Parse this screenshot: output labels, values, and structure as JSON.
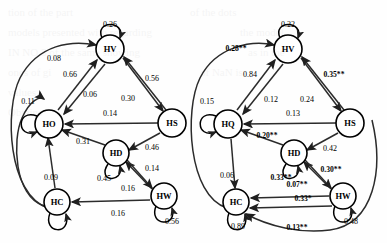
{
  "figure": {
    "type": "path-diagram-pair",
    "panels": [
      {
        "id": "left-panel",
        "name": "left-path-diagram",
        "nodes": [
          {
            "id": "HV",
            "label": "HV",
            "x": 110,
            "y": 49
          },
          {
            "id": "HO",
            "label": "HO",
            "x": 49,
            "y": 124
          },
          {
            "id": "HS",
            "label": "HS",
            "x": 172,
            "y": 123
          },
          {
            "id": "HD",
            "label": "HD",
            "x": 116,
            "y": 153
          },
          {
            "id": "HC",
            "label": "HC",
            "x": 57,
            "y": 202
          },
          {
            "id": "HW",
            "label": "HW",
            "x": 164,
            "y": 196
          }
        ],
        "self_loops": [
          {
            "node": "HV",
            "label": "0.26",
            "lx": 110,
            "ly": 24
          },
          {
            "node": "HO",
            "label": "0.11",
            "lx": 28,
            "ly": 101
          },
          {
            "node": "HD",
            "label": "0.45",
            "lx": 104,
            "ly": 178
          },
          {
            "node": "HW",
            "label": "0.56",
            "lx": 172,
            "ly": 221
          },
          {
            "node": "HC",
            "label": "",
            "lx": 0,
            "ly": 0
          }
        ],
        "edges": [
          {
            "from": "HC",
            "to": "HV",
            "label": "0.08",
            "lx": 54,
            "ly": 58
          },
          {
            "from": "HO",
            "to": "HV",
            "label": "0.66",
            "lx": 70,
            "ly": 74
          },
          {
            "from": "HV",
            "to": "HO",
            "label": "0.06",
            "lx": 90,
            "ly": 94
          },
          {
            "from": "HV",
            "to": "HS",
            "label": "0.56",
            "lx": 152,
            "ly": 78
          },
          {
            "from": "HS",
            "to": "HV",
            "label": "0.30",
            "lx": 128,
            "ly": 98
          },
          {
            "from": "HS",
            "to": "HO",
            "label": "0.14",
            "lx": 110,
            "ly": 113
          },
          {
            "from": "HD",
            "to": "HO",
            "label": "0.31",
            "lx": 83,
            "ly": 141
          },
          {
            "from": "HS",
            "to": "HD",
            "label": "0.46",
            "lx": 152,
            "ly": 147
          },
          {
            "from": "HW",
            "to": "HD",
            "label": "0.14",
            "lx": 152,
            "ly": 168
          },
          {
            "from": "HC",
            "to": "HO",
            "label": "0.09",
            "lx": 51,
            "ly": 177
          },
          {
            "from": "HD",
            "to": "HW",
            "label": "0.16",
            "lx": 128,
            "ly": 188
          },
          {
            "from": "HW",
            "to": "HC",
            "label": "0.16",
            "lx": 118,
            "ly": 213
          }
        ]
      },
      {
        "id": "right-panel",
        "name": "right-path-diagram",
        "nodes": [
          {
            "id": "HV",
            "label": "HV",
            "x": 288,
            "y": 49
          },
          {
            "id": "HQ",
            "label": "HQ",
            "x": 228,
            "y": 124
          },
          {
            "id": "HS",
            "label": "HS",
            "x": 350,
            "y": 123
          },
          {
            "id": "HD",
            "label": "HD",
            "x": 294,
            "y": 153
          },
          {
            "id": "HC",
            "label": "HC",
            "x": 236,
            "y": 202
          },
          {
            "id": "HW",
            "label": "HW",
            "x": 343,
            "y": 196
          }
        ],
        "self_loops": [
          {
            "node": "HV",
            "label": "0.22",
            "lx": 288,
            "ly": 24
          },
          {
            "node": "HQ",
            "label": "0.15",
            "lx": 207,
            "ly": 101
          },
          {
            "node": "HD",
            "label": "0.33**",
            "lx": 281,
            "ly": 177
          },
          {
            "node": "HW",
            "label": "0.48",
            "lx": 351,
            "ly": 221
          },
          {
            "node": "HC",
            "label": "0.89",
            "lx": 238,
            "ly": 226
          }
        ],
        "edges": [
          {
            "from": "HC",
            "to": "HV",
            "label": "0.28**",
            "lx": 236,
            "ly": 48
          },
          {
            "from": "HQ",
            "to": "HV",
            "label": "0.84",
            "lx": 250,
            "ly": 74
          },
          {
            "from": "HV",
            "to": "HS",
            "label": "0.35**",
            "lx": 334,
            "ly": 74
          },
          {
            "from": "HV",
            "to": "HQ",
            "label": "0.12",
            "lx": 271,
            "ly": 99
          },
          {
            "from": "HS",
            "to": "HV",
            "label": "0.24",
            "lx": 307,
            "ly": 99
          },
          {
            "from": "HS",
            "to": "HQ",
            "label": "0.13",
            "lx": 293,
            "ly": 113
          },
          {
            "from": "HD",
            "to": "HQ",
            "label": "0.20**",
            "lx": 267,
            "ly": 135
          },
          {
            "from": "HS",
            "to": "HD",
            "label": "0.42",
            "lx": 330,
            "ly": 148
          },
          {
            "from": "HW",
            "to": "HD",
            "label": "0.30**",
            "lx": 331,
            "ly": 169
          },
          {
            "from": "HQ",
            "to": "HC",
            "label": "0.06",
            "lx": 227,
            "ly": 175
          },
          {
            "from": "HW",
            "to": "HC",
            "label": "0.07**",
            "lx": 297,
            "ly": 184
          },
          {
            "from": "HW",
            "to": "HC",
            "label": "0.33*",
            "lx": 303,
            "ly": 198
          },
          {
            "from": "HW",
            "to": "HC",
            "label": "0.13**",
            "lx": 297,
            "ly": 227
          }
        ]
      }
    ]
  },
  "colors": {
    "stroke": "#2b2b2b",
    "node_fill": "#ffffff",
    "text": "#000000"
  },
  "background_text": {
    "lines": [
      "the of equation",
      "and regarding",
      "model as the",
      "values in",
      "note the"
    ]
  }
}
